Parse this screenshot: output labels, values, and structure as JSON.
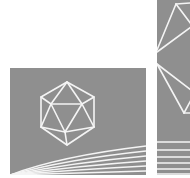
{
  "artwork": {
    "description": "Two gray panels with white wireframe icosahedron and fanned lines",
    "colors": {
      "background": "#ffffff",
      "panel": "#8f8f8f",
      "stroke": "#f4f4f4"
    },
    "panels": [
      {
        "name": "left-panel",
        "motif": "icosahedron-wireframe",
        "line_fan_count": 6
      },
      {
        "name": "right-panel",
        "motif": "icosahedron-wireframe-cropped",
        "horizontal_line_count": 6
      }
    ]
  }
}
